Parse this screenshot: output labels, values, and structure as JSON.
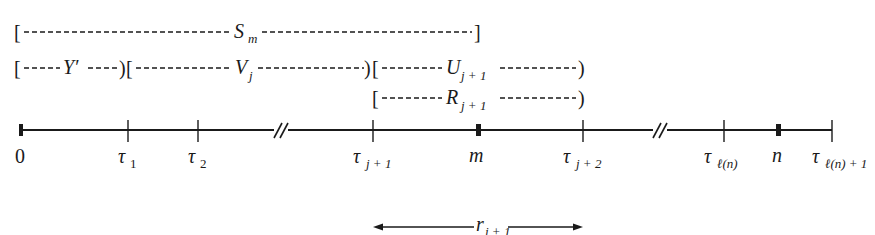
{
  "diagram": {
    "type": "timeline-intervals",
    "intervals": [
      {
        "id": "S_m",
        "label": "S",
        "sub": "m",
        "open": "[",
        "close": "]",
        "row": 0,
        "from": "0",
        "to": "m"
      },
      {
        "id": "Y_prime",
        "label": "Y′",
        "sub": "",
        "open": "[",
        "close": ")",
        "row": 1,
        "from": "0",
        "to": "τ1"
      },
      {
        "id": "V_j",
        "label": "V",
        "sub": "j",
        "open": "[",
        "close": ")",
        "row": 1,
        "from": "τ1",
        "to": "τj+1"
      },
      {
        "id": "U_j1",
        "label": "U",
        "sub": "j + 1",
        "open": "[",
        "close": ")",
        "row": 1,
        "from": "τj+1",
        "to": "τj+2"
      },
      {
        "id": "R_j1",
        "label": "R",
        "sub": "j + 1",
        "open": "[",
        "close": ")",
        "row": 2,
        "from": "τj+1",
        "to": "τj+2"
      }
    ],
    "axis": {
      "points": [
        {
          "label": "0",
          "sub": "",
          "kind": "endpoint",
          "italic": false
        },
        {
          "label": "τ",
          "sub": "1",
          "kind": "tick",
          "italic": true
        },
        {
          "label": "τ",
          "sub": "2",
          "kind": "tick",
          "italic": true
        },
        {
          "label": "//",
          "sub": "",
          "kind": "break",
          "italic": false
        },
        {
          "label": "τ",
          "sub": "j + 1",
          "kind": "tick",
          "italic": true
        },
        {
          "label": "m",
          "sub": "",
          "kind": "endpoint",
          "italic": true
        },
        {
          "label": "τ",
          "sub": "j + 2",
          "kind": "tick",
          "italic": true
        },
        {
          "label": "//",
          "sub": "",
          "kind": "break",
          "italic": false
        },
        {
          "label": "τ",
          "sub": "ℓ(n)",
          "kind": "tick",
          "italic": true
        },
        {
          "label": "n",
          "sub": "",
          "kind": "endpoint",
          "italic": true
        },
        {
          "label": "τ",
          "sub": "ℓ(n) + 1",
          "kind": "tick",
          "italic": true
        }
      ]
    },
    "span_arrow": {
      "label": "r",
      "sub": "j + 1",
      "from": "τj+1",
      "to": "τj+2"
    }
  }
}
